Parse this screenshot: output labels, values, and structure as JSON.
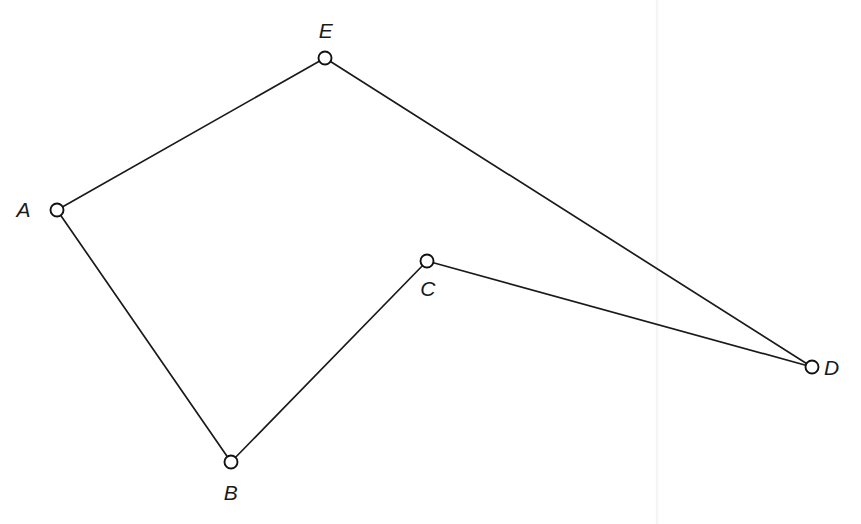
{
  "figure": {
    "background_color": "#ffffff",
    "stroke_color": "#1a1a1a",
    "marker_fill": "#ffffff",
    "artifact_color": "#f4f4f6"
  },
  "chart_data": {
    "type": "scatter",
    "xlabel": "",
    "ylabel": "",
    "xlim": [
      0,
      861
    ],
    "ylim": [
      0,
      524
    ],
    "grid": false,
    "legend": null,
    "vertices": [
      {
        "label": "A",
        "x": 57,
        "y": 210,
        "label_x": 31,
        "label_y": 217,
        "label_anchor": "end"
      },
      {
        "label": "B",
        "x": 231,
        "y": 462,
        "label_x": 231,
        "label_y": 500,
        "label_anchor": "middle"
      },
      {
        "label": "C",
        "x": 427,
        "y": 261,
        "label_x": 428,
        "label_y": 296,
        "label_anchor": "middle"
      },
      {
        "label": "D",
        "x": 812,
        "y": 367,
        "label_x": 824,
        "label_y": 375,
        "label_anchor": "start"
      },
      {
        "label": "E",
        "x": 325,
        "y": 58,
        "label_x": 326,
        "label_y": 38,
        "label_anchor": "middle"
      }
    ],
    "edges": [
      {
        "name": "A-E",
        "from": "A",
        "to": "E"
      },
      {
        "name": "E-D",
        "from": "E",
        "to": "D"
      },
      {
        "name": "D-C",
        "from": "D",
        "to": "C"
      },
      {
        "name": "C-B",
        "from": "C",
        "to": "B"
      },
      {
        "name": "B-A",
        "from": "B",
        "to": "A"
      }
    ],
    "marker_radius": 6.5,
    "artifact_line": {
      "x": 657,
      "y1": 0,
      "y2": 524
    }
  }
}
